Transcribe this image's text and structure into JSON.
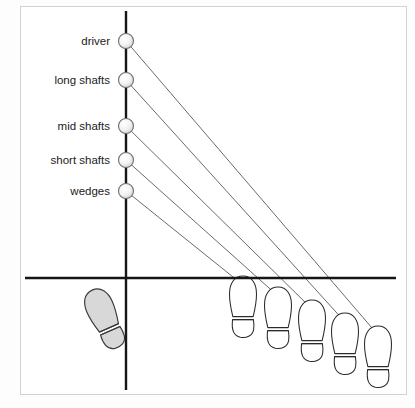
{
  "credit": {
    "text": "REPRODUCED COURTESY OF AMELIA ALLDAY-WHITE"
  },
  "figure": {
    "colors": {
      "axis": "#161616",
      "ray": "#555555",
      "outline": "#2b2b2b",
      "ball_fill": "#f4f4f4",
      "ball_edge": "#6a6a6a",
      "lead_foot_fill": "#d6d6d6",
      "frame": "#d2d2d2",
      "background": "#ffffff"
    },
    "axes": {
      "vertical_x": 105,
      "vertical_y1": 4,
      "vertical_y2": 383,
      "horizontal_y": 271,
      "horizontal_x1": 4,
      "horizontal_x2": 375
    },
    "lead_foot": {
      "name": "lead-foot",
      "label": "lead foot",
      "cx": 84,
      "cy": 312,
      "rotation": -24,
      "filled": true
    },
    "ball_positions": [
      {
        "label": "driver",
        "x": 105,
        "y": 34,
        "r": 7.5
      },
      {
        "label": "long shafts",
        "x": 105,
        "y": 73,
        "r": 7.5
      },
      {
        "label": "mid shafts",
        "x": 105,
        "y": 119,
        "r": 7.5
      },
      {
        "label": "short shafts",
        "x": 105,
        "y": 153,
        "r": 7.5
      },
      {
        "label": "wedges",
        "x": 105,
        "y": 184,
        "r": 7.5
      }
    ],
    "label_right_edge": 91,
    "trail_feet": [
      {
        "for": "wedges",
        "cx": 222,
        "cy": 300,
        "rotation": 0
      },
      {
        "for": "short shafts",
        "cx": 257,
        "cy": 311,
        "rotation": 0
      },
      {
        "for": "mid shafts",
        "cx": 291,
        "cy": 324,
        "rotation": 0
      },
      {
        "for": "long shafts",
        "cx": 324,
        "cy": 337,
        "rotation": 0
      },
      {
        "for": "driver",
        "cx": 357,
        "cy": 350,
        "rotation": 0
      }
    ],
    "rays": [
      {
        "from": "driver",
        "x1": 105,
        "y1": 34,
        "x2": 357,
        "y2": 328
      },
      {
        "from": "long shafts",
        "x1": 105,
        "y1": 73,
        "x2": 324,
        "y2": 315
      },
      {
        "from": "mid shafts",
        "x1": 105,
        "y1": 119,
        "x2": 291,
        "y2": 302
      },
      {
        "from": "short shafts",
        "x1": 105,
        "y1": 153,
        "x2": 257,
        "y2": 289
      },
      {
        "from": "wedges",
        "x1": 105,
        "y1": 184,
        "x2": 222,
        "y2": 278
      }
    ]
  }
}
